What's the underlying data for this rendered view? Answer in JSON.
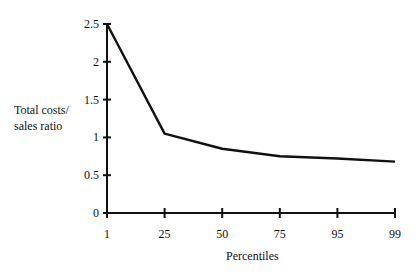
{
  "chart_data": {
    "type": "line",
    "title": "",
    "xlabel": "Percentiles",
    "ylabel": "Total costs/\nsales ratio",
    "categories": [
      "1",
      "25",
      "50",
      "75",
      "95",
      "99"
    ],
    "series": [
      {
        "name": "Total costs/sales ratio",
        "values": [
          2.5,
          1.05,
          0.85,
          0.75,
          0.72,
          0.68
        ]
      }
    ],
    "yticks": [
      "0",
      "0.5",
      "1",
      "1.5",
      "2",
      "2.5"
    ],
    "ylim": [
      0,
      2.5
    ],
    "grid": false,
    "legend": null
  }
}
